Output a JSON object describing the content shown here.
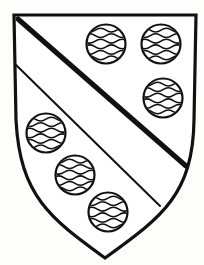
{
  "image": {
    "title": "Heraldic escutcheon",
    "blazon": "A bend between six fountains",
    "width": 204,
    "height": 265,
    "background_color": "#fdfdfc",
    "ink_color": "#111111"
  },
  "shield": {
    "name": "escutcheon-outline",
    "stroke_color": "#111111",
    "stroke_width": 3.2,
    "fill_color": "#ffffff",
    "top_left": [
      14,
      15
    ],
    "top_right": [
      196,
      15
    ],
    "bottom_point": [
      105,
      258
    ],
    "left_curve_control": [
      20,
      196
    ],
    "right_curve_control": [
      193,
      196
    ]
  },
  "ordinary": {
    "name": "bend",
    "description": "thick diagonal band from dexter chief to sinister base",
    "stroke_color": "#111111",
    "thick_line_width": 5.0,
    "thin_line_width": 2.0,
    "thick_start": [
      18,
      19
    ],
    "thick_end": [
      186,
      166
    ],
    "thin_start": [
      15,
      64
    ],
    "thin_end": [
      160,
      206
    ]
  },
  "charges": {
    "name": "fountains",
    "count": 6,
    "radius": 19.5,
    "outline_color": "#111111",
    "outline_width": 2.2,
    "fill_color": "#ffffff",
    "wave_color": "#111111",
    "wave_width": 1.5,
    "wave_count": 6,
    "items": [
      {
        "label": "fountain-1",
        "position": "chief-dexter",
        "cx": 106,
        "cy": 44,
        "r": 19.5
      },
      {
        "label": "fountain-2",
        "position": "chief-sinister",
        "cx": 161,
        "cy": 44,
        "r": 19.5
      },
      {
        "label": "fountain-3",
        "position": "flank-sinister",
        "cx": 163,
        "cy": 98,
        "r": 19.5
      },
      {
        "label": "fountain-4",
        "position": "flank-dexter",
        "cx": 46,
        "cy": 133,
        "r": 19.5
      },
      {
        "label": "fountain-5",
        "position": "base-dexter",
        "cx": 75,
        "cy": 175,
        "r": 19.5
      },
      {
        "label": "fountain-6",
        "position": "base-centre",
        "cx": 108,
        "cy": 212,
        "r": 19.5
      }
    ]
  }
}
